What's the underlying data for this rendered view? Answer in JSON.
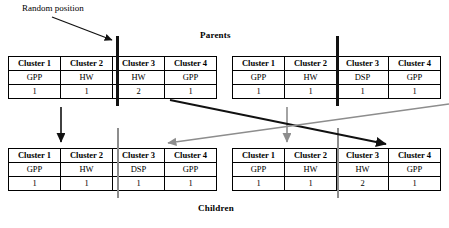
{
  "diagram": {
    "title_parents": "Parents",
    "title_children": "Children",
    "annotation_random_position": "Random position"
  },
  "columns": [
    "Cluster 1",
    "Cluster 2",
    "Cluster 3",
    "Cluster 4"
  ],
  "chromosomes": {
    "parent_left": {
      "name": "parent-left",
      "tasks": [
        "GPP",
        "HW",
        "HW",
        "GPP"
      ],
      "counts": [
        "1",
        "1",
        "2",
        "1"
      ]
    },
    "parent_right": {
      "name": "parent-right",
      "tasks": [
        "GPP",
        "HW",
        "DSP",
        "GPP"
      ],
      "counts": [
        "1",
        "1",
        "1",
        "1"
      ]
    },
    "child_left": {
      "name": "child-left",
      "tasks": [
        "GPP",
        "HW",
        "DSP",
        "GPP"
      ],
      "counts": [
        "1",
        "1",
        "1",
        "1"
      ]
    },
    "child_right": {
      "name": "child-right",
      "tasks": [
        "GPP",
        "HW",
        "HW",
        "GPP"
      ],
      "counts": [
        "1",
        "1",
        "2",
        "1"
      ]
    }
  },
  "colors": {
    "cut_bar_parent": "#111111",
    "cut_bar_child": "#8d8d8d",
    "arrow_black": "#111111",
    "arrow_gray": "#8d8d8d",
    "border": "#000000",
    "background": "#ffffff"
  }
}
